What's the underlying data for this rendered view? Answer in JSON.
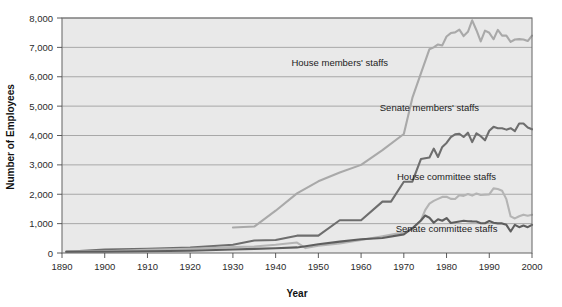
{
  "chart_data": {
    "type": "line",
    "title": "",
    "xlabel": "Year",
    "ylabel": "Number of Employees",
    "xlim": [
      1890,
      2000
    ],
    "ylim": [
      0,
      8000
    ],
    "grid": true,
    "legend_position": "inline-annotations",
    "xticks": [
      1890,
      1900,
      1910,
      1920,
      1930,
      1940,
      1950,
      1960,
      1970,
      1980,
      1990,
      2000
    ],
    "xtick_labels": [
      "1890",
      "1900",
      "1910",
      "1920",
      "1930",
      "1940",
      "1950",
      "1960",
      "1970",
      "1980",
      "1990",
      "2000"
    ],
    "yticks": [
      0,
      1000,
      2000,
      3000,
      4000,
      5000,
      6000,
      7000,
      8000
    ],
    "ytick_labels": [
      "0",
      "1,000",
      "2,000",
      "3,000",
      "4,000",
      "5,000",
      "6,000",
      "7,000",
      "8,000"
    ],
    "series": [
      {
        "name": "House members' staffs",
        "color": "#a9a9a9",
        "label_x": 1955,
        "label_y": 6350,
        "x": [
          1930,
          1935,
          1940,
          1945,
          1950,
          1955,
          1960,
          1965,
          1970,
          1972,
          1974,
          1976,
          1977,
          1978,
          1979,
          1980,
          1981,
          1982,
          1983,
          1984,
          1985,
          1986,
          1987,
          1988,
          1989,
          1990,
          1991,
          1992,
          1993,
          1994,
          1995,
          1996,
          1997,
          1998,
          1999,
          2000
        ],
        "values": [
          870,
          900,
          1440,
          2030,
          2440,
          2740,
          3000,
          3500,
          4050,
          5280,
          6114,
          6939,
          7000,
          7100,
          7067,
          7371,
          7487,
          7511,
          7606,
          7385,
          7528,
          7920,
          7584,
          7201,
          7569,
          7496,
          7278,
          7597,
          7400,
          7400,
          7186,
          7269,
          7282,
          7269,
          7216,
          7400
        ]
      },
      {
        "name": "Senate members' staffs",
        "color": "#6e6e6e",
        "label_x": 1976,
        "label_y": 4850,
        "x": [
          1891,
          1900,
          1910,
          1920,
          1930,
          1935,
          1940,
          1945,
          1950,
          1955,
          1960,
          1965,
          1967,
          1970,
          1972,
          1974,
          1976,
          1977,
          1978,
          1979,
          1980,
          1981,
          1982,
          1983,
          1984,
          1985,
          1986,
          1987,
          1988,
          1989,
          1990,
          1991,
          1992,
          1993,
          1994,
          1995,
          1996,
          1997,
          1998,
          1999,
          2000
        ],
        "values": [
          39,
          116,
          141,
          182,
          280,
          424,
          443,
          590,
          590,
          1115,
          1115,
          1749,
          1749,
          2426,
          2426,
          3197,
          3251,
          3554,
          3268,
          3612,
          3746,
          3945,
          4041,
          4059,
          3949,
          4097,
          3774,
          4075,
          3977,
          3837,
          4162,
          4294,
          4249,
          4249,
          4200,
          4247,
          4151,
          4410,
          4410,
          4272,
          4210
        ]
      },
      {
        "name": "House committee staffs",
        "color": "#b4b4b4",
        "label_x": 1980,
        "label_y": 2480,
        "x": [
          1891,
          1900,
          1910,
          1920,
          1930,
          1935,
          1940,
          1945,
          1947,
          1950,
          1955,
          1960,
          1965,
          1970,
          1972,
          1974,
          1975,
          1976,
          1977,
          1978,
          1979,
          1980,
          1981,
          1982,
          1983,
          1984,
          1985,
          1986,
          1987,
          1988,
          1989,
          1990,
          1991,
          1992,
          1993,
          1994,
          1995,
          1996,
          1997,
          1998,
          1999,
          2000
        ],
        "values": [
          62,
          62,
          105,
          140,
          200,
          220,
          280,
          356,
          167,
          246,
          329,
          440,
          571,
          702,
          817,
          1107,
          1460,
          1680,
          1776,
          1844,
          1909,
          1917,
          1843,
          1839,
          1970,
          1944,
          2009,
          1954,
          2024,
          1976,
          1986,
          1993,
          2201,
          2178,
          2118,
          1834,
          1246,
          1177,
          1250,
          1305,
          1267,
          1300
        ]
      },
      {
        "name": "Senate committee staffs",
        "color": "#5e5e5e",
        "label_x": 1980,
        "label_y": 730,
        "x": [
          1891,
          1900,
          1910,
          1920,
          1930,
          1935,
          1940,
          1945,
          1947,
          1950,
          1955,
          1960,
          1965,
          1970,
          1972,
          1974,
          1975,
          1976,
          1977,
          1978,
          1979,
          1980,
          1981,
          1982,
          1983,
          1984,
          1985,
          1986,
          1987,
          1988,
          1989,
          1990,
          1991,
          1992,
          1993,
          1994,
          1995,
          1996,
          1997,
          1998,
          1999,
          2000
        ],
        "values": [
          41,
          41,
          60,
          75,
          120,
          140,
          160,
          190,
          232,
          300,
          386,
          470,
          509,
          635,
          844,
          1107,
          1277,
          1201,
          1028,
          1151,
          1098,
          1191,
          1022,
          1047,
          1075,
          1095,
          1080,
          1075,
          1074,
          1013,
          1013,
          1090,
          1030,
          1008,
          1008,
          958,
          732,
          960,
          880,
          935,
          880,
          960
        ]
      }
    ]
  }
}
